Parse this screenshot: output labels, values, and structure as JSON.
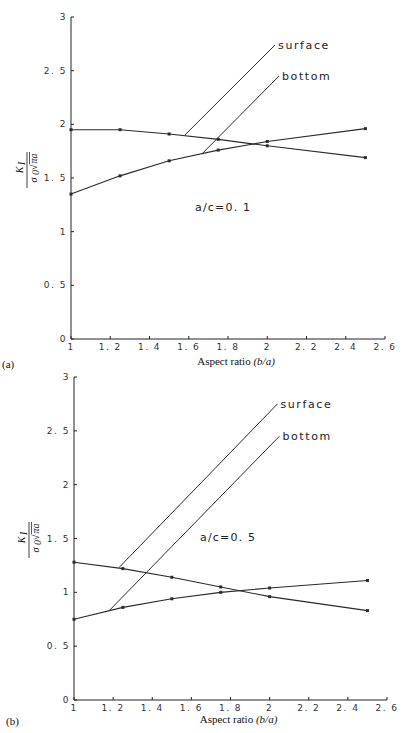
{
  "chart_data": [
    {
      "type": "line",
      "panel_label": "(a)",
      "annotation": "a/c=0. 1",
      "xlabel": "Aspect ratio",
      "xlabel_italic": "(b/a)",
      "ylabel": "K_I / (σ0 √πa)",
      "xlim": [
        1,
        2.6
      ],
      "ylim": [
        0,
        3
      ],
      "xticks": [
        "1",
        "1. 2",
        "1. 4",
        "1. 6",
        "1. 8",
        "2",
        "2. 2",
        "2. 4",
        "2. 6"
      ],
      "yticks": [
        "0",
        "0. 5",
        "1",
        "1. 5",
        "2",
        "2. 5",
        "3"
      ],
      "grid": false,
      "x": [
        1.0,
        1.25,
        1.5,
        1.75,
        2.0,
        2.5
      ],
      "series": [
        {
          "name": "surface",
          "values": [
            1.95,
            1.95,
            1.91,
            1.86,
            1.8,
            1.69
          ]
        },
        {
          "name": "bottom",
          "values": [
            1.35,
            1.52,
            1.66,
            1.76,
            1.84,
            1.96
          ]
        }
      ],
      "legend": [
        {
          "label": "surface",
          "leader_from": [
            1.58,
            1.9
          ],
          "leader_to": [
            2.04,
            2.74
          ]
        },
        {
          "label": "bottom",
          "leader_from": [
            1.67,
            1.73
          ],
          "leader_to": [
            2.06,
            2.45
          ]
        }
      ]
    },
    {
      "type": "line",
      "panel_label": "(b)",
      "annotation": "a/c=0. 5",
      "xlabel": "Aspect ratio",
      "xlabel_italic": "(b/a)",
      "ylabel": "K_I / (σ0 √πa)",
      "xlim": [
        1,
        2.6
      ],
      "ylim": [
        0,
        3
      ],
      "xticks": [
        "1",
        "1. 2",
        "1. 4",
        "1. 6",
        "1. 8",
        "2",
        "2. 2",
        "2. 4",
        "2. 6"
      ],
      "yticks": [
        "0",
        "0. 5",
        "1",
        "1. 5",
        "2",
        "2. 5",
        "3"
      ],
      "grid": false,
      "x": [
        1.0,
        1.25,
        1.5,
        1.75,
        2.0,
        2.5
      ],
      "series": [
        {
          "name": "surface",
          "values": [
            1.28,
            1.22,
            1.14,
            1.05,
            0.96,
            0.83
          ]
        },
        {
          "name": "bottom",
          "values": [
            0.75,
            0.86,
            0.94,
            1.0,
            1.04,
            1.11
          ]
        }
      ],
      "legend": [
        {
          "label": "surface",
          "leader_from": [
            1.23,
            1.23
          ],
          "leader_to": [
            2.04,
            2.75
          ]
        },
        {
          "label": "bottom",
          "leader_from": [
            1.18,
            0.83
          ],
          "leader_to": [
            2.05,
            2.45
          ]
        }
      ]
    }
  ]
}
